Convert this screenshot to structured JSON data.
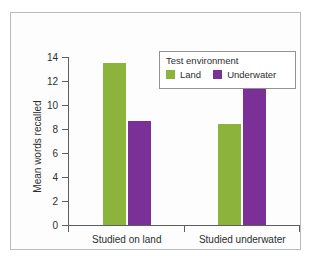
{
  "chart_data": {
    "type": "bar",
    "title": "",
    "xlabel": "",
    "ylabel": "Mean words recalled",
    "categories": [
      "Studied on land",
      "Studied underwater"
    ],
    "series": [
      {
        "name": "Land",
        "color": "#8CB33C",
        "values": [
          13.5,
          8.4
        ]
      },
      {
        "name": "Underwater",
        "color": "#7B3098",
        "values": [
          8.7,
          11.5
        ]
      }
    ],
    "ylim": [
      0,
      14
    ],
    "ytick_step": 2,
    "yticks": [
      "14",
      "12",
      "10",
      "8",
      "6",
      "4",
      "2",
      "0"
    ],
    "grid": false,
    "legend": {
      "title": "Test environment",
      "position": "top-right",
      "entries": [
        {
          "label": "Land",
          "color": "#8CB33C"
        },
        {
          "label": "Underwater",
          "color": "#7B3098"
        }
      ]
    }
  }
}
